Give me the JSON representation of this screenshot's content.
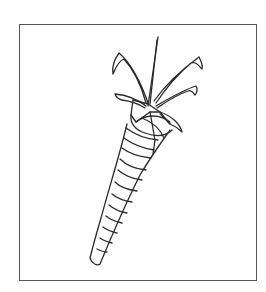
{
  "illustration": {
    "subject": "carrot",
    "style": "black line drawing",
    "stroke_color": "#2a2a2a",
    "frame_color": "#555555",
    "background": "#ffffff",
    "parts": [
      "leaves",
      "stem",
      "crown",
      "root-body",
      "ridges",
      "tip"
    ]
  }
}
